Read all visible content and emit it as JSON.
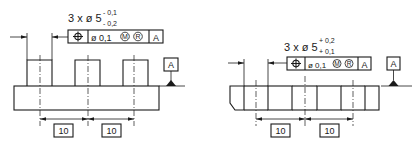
{
  "left": {
    "callout": {
      "prefix": "3 x ø 5",
      "upper_tol": "- 0,1",
      "lower_tol": "- 0,2"
    },
    "frame": {
      "symbol": "position-icon",
      "tolerance": "ø 0,1",
      "modifier1": "M",
      "modifier2": "R",
      "datum": "A"
    },
    "datum_label": "A",
    "dims": [
      "10",
      "10"
    ]
  },
  "right": {
    "callout": {
      "prefix": "3 x ø 5",
      "upper_tol": "+ 0,2",
      "lower_tol": "+ 0,1"
    },
    "frame": {
      "symbol": "position-icon",
      "tolerance": "ø 0,1",
      "modifier1": "M",
      "modifier2": "R",
      "datum": "A"
    },
    "datum_label": "A",
    "dims": [
      "10",
      "10"
    ]
  },
  "colors": {
    "ink": "#1a1a1a",
    "background": "#ffffff"
  }
}
